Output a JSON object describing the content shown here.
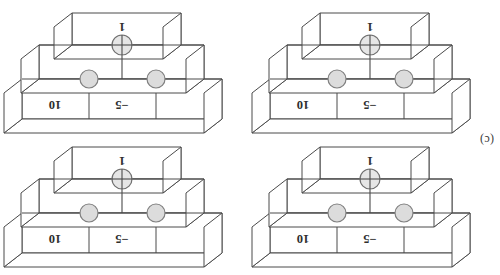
{
  "figure": {
    "caption_label": "(c)",
    "panel_count": 4
  },
  "colors": {
    "line": "#4a4a4a",
    "face": "#ffffff",
    "control_fill": "#dcdcdc",
    "control_stroke": "#808080",
    "target_fill": "#e6e6e6",
    "target_stroke": "#707070",
    "text": "#2e2e2e",
    "background": "#ffffff"
  },
  "panels": [
    {
      "id": "panel-top-left",
      "labels": {
        "weight_top": "−5",
        "weight_right": "10",
        "weight_bottom": "1"
      },
      "gates": [
        {
          "name": "control-dot-left",
          "type": "control"
        },
        {
          "name": "control-dot-right",
          "type": "control"
        },
        {
          "name": "target-plus",
          "type": "target"
        }
      ]
    },
    {
      "id": "panel-top-right",
      "labels": {
        "weight_top": "−5",
        "weight_right": "10",
        "weight_bottom": "1"
      },
      "gates": [
        {
          "name": "control-dot-left",
          "type": "control"
        },
        {
          "name": "control-dot-right",
          "type": "control"
        },
        {
          "name": "target-plus",
          "type": "target"
        }
      ]
    },
    {
      "id": "panel-bottom-left",
      "labels": {
        "weight_top": "−5",
        "weight_right": "10",
        "weight_bottom": "1"
      },
      "gates": [
        {
          "name": "control-dot-left",
          "type": "control"
        },
        {
          "name": "control-dot-right",
          "type": "control"
        },
        {
          "name": "target-plus",
          "type": "target"
        }
      ]
    },
    {
      "id": "panel-bottom-right",
      "labels": {
        "weight_top": "−5",
        "weight_right": "10",
        "weight_bottom": "1"
      },
      "gates": [
        {
          "name": "control-dot-left",
          "type": "control"
        },
        {
          "name": "control-dot-right",
          "type": "control"
        },
        {
          "name": "target-plus",
          "type": "target"
        }
      ]
    }
  ]
}
